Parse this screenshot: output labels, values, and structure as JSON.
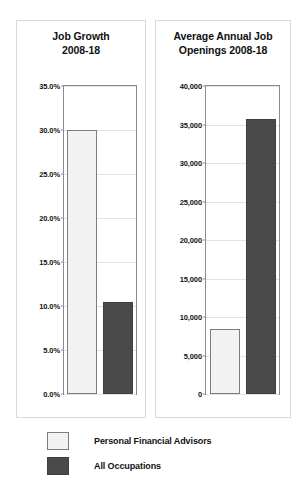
{
  "legend": {
    "position": "bottom-left",
    "entries": [
      {
        "label": "Personal Financial Advisors",
        "swatch": "light",
        "color": "#f2f2f2"
      },
      {
        "label": "All Occupations",
        "swatch": "dark",
        "color": "#4a4a4a"
      }
    ]
  },
  "chart_data": [
    {
      "type": "bar",
      "title": "Job Growth 2008-18",
      "title_lines": [
        "Job Growth",
        "2008-18"
      ],
      "xlabel": "",
      "ylabel": "",
      "ylim": [
        0,
        35
      ],
      "yticks": [
        0,
        5,
        10,
        15,
        20,
        25,
        30,
        35
      ],
      "ytick_labels": [
        "0.0%",
        "5.0%",
        "10.0%",
        "15.0%",
        "20.0%",
        "25.0%",
        "30.0%",
        "35.0%"
      ],
      "grid": true,
      "categories": [
        "Personal Financial Advisors",
        "All Occupations"
      ],
      "values": [
        30.0,
        10.4
      ],
      "value_labels": [
        "30.0%",
        "10.4%"
      ],
      "colors": [
        "#f2f2f2",
        "#4a4a4a"
      ]
    },
    {
      "type": "bar",
      "title": "Average Annual Job Openings 2008-18",
      "title_lines": [
        "Average Annual Job",
        "Openings 2008-18"
      ],
      "xlabel": "",
      "ylabel": "",
      "ylim": [
        0,
        40000
      ],
      "yticks": [
        0,
        5000,
        10000,
        15000,
        20000,
        25000,
        30000,
        35000,
        40000
      ],
      "ytick_labels": [
        "0",
        "5,000",
        "10,000",
        "15,000",
        "20,000",
        "25,000",
        "30,000",
        "35,000",
        "40,000"
      ],
      "grid": true,
      "categories": [
        "Personal Financial Advisors",
        "All Occupations"
      ],
      "values": [
        8500,
        35700
      ],
      "value_labels": [
        "8,500",
        "35,700"
      ],
      "colors": [
        "#f2f2f2",
        "#4a4a4a"
      ]
    }
  ]
}
